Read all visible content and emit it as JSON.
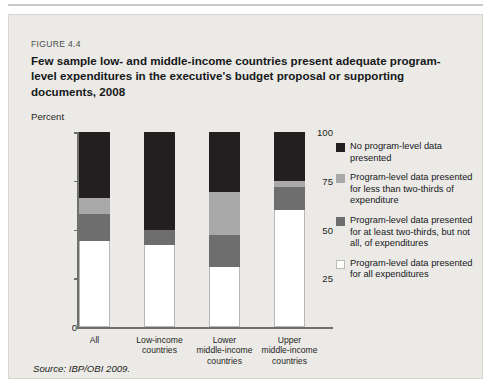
{
  "figure": {
    "number": "FIGURE 4.4",
    "title": "Few sample low- and middle-income countries present adequate program-level expenditures in the executive's budget proposal or supporting documents, 2008",
    "source": "Source: IBP/OBI 2009."
  },
  "chart_data": {
    "type": "bar",
    "subtype": "stacked-100-percent",
    "title": "Few sample low- and middle-income countries present adequate program-level expenditures in the executive's budget proposal or supporting documents, 2008",
    "xlabel": "",
    "ylabel": "Percent",
    "ylim": [
      0,
      100
    ],
    "yticks": [
      0,
      25,
      50,
      75,
      100
    ],
    "ytick_labels": [
      "0",
      "25",
      "50",
      "75",
      "100"
    ],
    "grid": false,
    "legend_position": "right",
    "categories": [
      "All",
      "Low-income countries",
      "Lower middle-income countries",
      "Upper middle-income countries"
    ],
    "category_lines": [
      [
        "All"
      ],
      [
        "Low-income",
        "countries"
      ],
      [
        "Lower",
        "middle-income",
        "countries"
      ],
      [
        "Upper",
        "middle-income",
        "countries"
      ]
    ],
    "series": [
      {
        "name": "Program-level data presented for all expenditures",
        "color": "#ffffff",
        "values": [
          44,
          42,
          31,
          60
        ]
      },
      {
        "name": "Program-level data presented for at least two-thirds, but not all, of expenditures",
        "color": "#6e6e6e",
        "values": [
          14,
          8,
          16,
          12
        ]
      },
      {
        "name": "Program-level data presented for less than two-thirds of expenditure",
        "color": "#a9a9a9",
        "values": [
          8,
          0,
          22,
          3
        ]
      },
      {
        "name": "No program-level data presented",
        "color": "#231f20",
        "values": [
          34,
          50,
          31,
          25
        ]
      }
    ]
  },
  "legend": {
    "entries": [
      {
        "color": "#231f20",
        "label": "No program-level data presented"
      },
      {
        "color": "#a9a9a9",
        "label": "Program-level data presented for less than two-thirds of expenditure"
      },
      {
        "color": "#6e6e6e",
        "label": "Program-level data presented for at least two-thirds, but not all, of expenditures"
      },
      {
        "color": "#ffffff",
        "label": "Program-level data presented for all expenditures"
      }
    ]
  },
  "colors": {
    "panel_background": "#eceae7",
    "axis": "#6f6f6f",
    "text": "#1d1f21"
  }
}
